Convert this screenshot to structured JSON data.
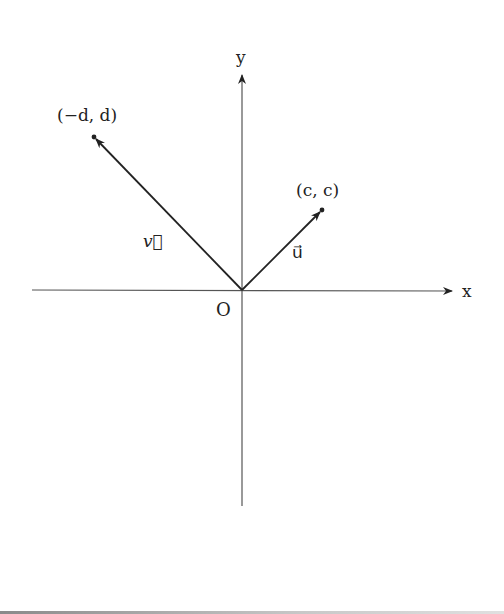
{
  "diagram": {
    "type": "vector-diagram",
    "axes": {
      "x_label": "x",
      "y_label": "y",
      "origin_label": "O"
    },
    "points": [
      {
        "name": "point-neg-d-d",
        "label": "(−d, d)"
      },
      {
        "name": "point-c-c",
        "label": "(c, c)"
      }
    ],
    "vectors": [
      {
        "name": "vector-v",
        "label": "v⃗",
        "from": "O",
        "to": "(−d, d)"
      },
      {
        "name": "vector-u",
        "label": "u⃗",
        "from": "O",
        "to": "(c, c)"
      }
    ],
    "colors": {
      "stroke": "#222222",
      "axis": "#444444",
      "background": "#ffffff"
    }
  }
}
